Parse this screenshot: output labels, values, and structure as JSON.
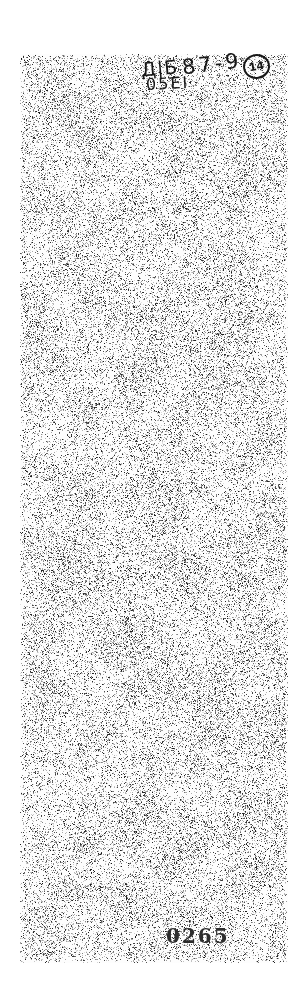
{
  "document": {
    "handwritten_annotation": {
      "segment1": "Д|Б̲",
      "segment2": "87-9",
      "circled_number": "14",
      "segment3": "05ЕІ"
    },
    "stamp_number": "0265"
  },
  "colors": {
    "paper": "#ffffff",
    "scan_base": "#fdfdfd",
    "ink": "#171717",
    "stamp_ink": "#2d2d2d"
  }
}
